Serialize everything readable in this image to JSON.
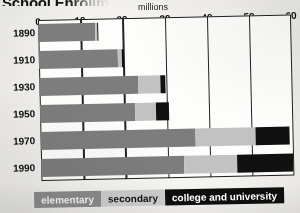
{
  "chart_title": "School Enrollment",
  "units_label": "millions",
  "legend": {
    "elementary": "elementary",
    "secondary": "secondary",
    "college": "college and university"
  },
  "colors": {
    "elementary": "#7d7d7d",
    "secondary": "#c2c2c2",
    "college": "#111111",
    "axis": "#1d1d1d",
    "paper": "#f5f4f1"
  },
  "chart_data": {
    "type": "bar",
    "orientation": "horizontal",
    "stacked": true,
    "title": "School Enrollment",
    "subtitle": "millions",
    "xlabel": "millions",
    "ylabel": "",
    "xlim": [
      0,
      60
    ],
    "xticks": [
      0,
      10,
      20,
      30,
      40,
      50,
      60
    ],
    "xtick_labels": [
      "0",
      "10",
      "20",
      "30",
      "40",
      "50",
      "60"
    ],
    "grid": true,
    "legend_position": "bottom",
    "categories": [
      "1890",
      "1910",
      "1930",
      "1950",
      "1970",
      "1990"
    ],
    "series": [
      {
        "name": "elementary",
        "color": "#7d7d7d",
        "values": [
          13.5,
          18.8,
          23.4,
          22.6,
          36.7,
          34.0
        ]
      },
      {
        "name": "secondary",
        "color": "#c2c2c2",
        "values": [
          0.4,
          1.0,
          5.4,
          5.0,
          14.4,
          12.4
        ]
      },
      {
        "name": "college and university",
        "color": "#111111",
        "values": [
          0.2,
          0.4,
          1.2,
          3.0,
          8.0,
          13.4
        ]
      }
    ],
    "totals": [
      14.1,
      20.2,
      30.0,
      30.6,
      59.1,
      59.8
    ]
  }
}
